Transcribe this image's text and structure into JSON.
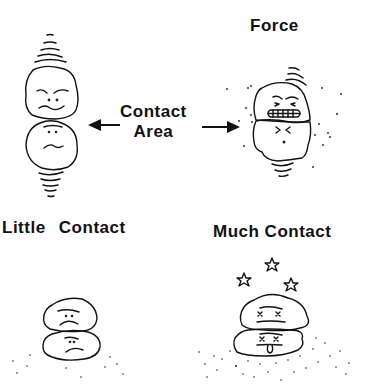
{
  "diagram": {
    "labels": {
      "force": "Force",
      "contact_area_line1": "Contact",
      "contact_area_line2": "Area",
      "little_contact": "Little  Contact",
      "much_contact": "Much Contact"
    },
    "panels": [
      {
        "id": "top-left",
        "description": "Two round particles touching at a single point, vibration lines above and below, worried faces"
      },
      {
        "id": "top-right",
        "description": "Two particles pressed together under force, gritted-teeth face, scattered dust dots"
      },
      {
        "id": "bottom-left",
        "description": "Two stacked particles with little contact, sad faces, few dots beneath"
      },
      {
        "id": "bottom-right",
        "description": "Two flattened stacked particles with much contact, X-eyes, tongue out, stars overhead, many dots"
      }
    ],
    "arrows": [
      {
        "direction": "left",
        "from": "contact-area-label",
        "to": "top-left-contact-point"
      },
      {
        "direction": "right",
        "from": "contact-area-label",
        "to": "top-right-contact-zone"
      }
    ],
    "colors": {
      "ink": "#111111",
      "background": "#ffffff"
    }
  }
}
